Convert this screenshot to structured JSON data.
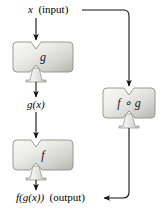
{
  "figure": {
    "background": "#ffffff",
    "ink": "#000000",
    "machine_fill_light": "#f2f2f0",
    "machine_fill_mid": "#d9d9d6",
    "machine_fill_dark": "#b9b9b5",
    "machine_stroke": "#8f8f8b"
  },
  "labels": {
    "input": {
      "symbol": "x",
      "note": "(input)"
    },
    "intermediate": {
      "symbol": "g(x)"
    },
    "output": {
      "symbol": "f(g(x))",
      "note": "(output)"
    }
  },
  "machines": [
    {
      "id": "g",
      "label": "g",
      "role": "inner-function"
    },
    {
      "id": "f",
      "label": "f",
      "role": "outer-function"
    },
    {
      "id": "fg",
      "label": "f ∘ g",
      "role": "composite-function"
    }
  ],
  "edges": [
    {
      "from": "input",
      "to": "machine-g",
      "kind": "arrow-down"
    },
    {
      "from": "machine-g",
      "to": "g(x)",
      "kind": "arrow-down"
    },
    {
      "from": "g(x)",
      "to": "machine-f",
      "kind": "arrow-down"
    },
    {
      "from": "machine-f",
      "to": "output",
      "kind": "arrow-down"
    },
    {
      "from": "input",
      "to": "machine-fg",
      "kind": "elbow-right-down-arrow"
    },
    {
      "from": "machine-fg",
      "to": "output",
      "kind": "elbow-down-left-arrow"
    }
  ]
}
